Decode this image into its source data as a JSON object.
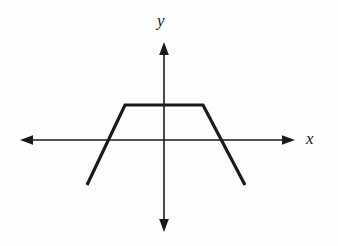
{
  "figure": {
    "background_color": "#fdfdfd",
    "stroke_color": "#1a1a1a",
    "axis_stroke_width": 1.6,
    "curve_stroke_width": 3.2
  },
  "axes": {
    "x_axis": {
      "label": "x",
      "label_style": "italic",
      "y_pixel": 140,
      "x_start_pixel": 20,
      "x_end_pixel": 295,
      "arrow_left": true,
      "arrow_right": true
    },
    "y_axis": {
      "label": "y",
      "label_style": "italic",
      "x_pixel": 164,
      "y_top_pixel": 42,
      "y_bottom_pixel": 232,
      "arrow_up": true,
      "arrow_down": true
    },
    "origin": {
      "x_pixel": 164,
      "y_pixel": 140
    },
    "ticks": [],
    "gridlines": false
  },
  "chart_data": {
    "type": "line",
    "title": "",
    "subtitle": "",
    "xlabel": "x",
    "ylabel": "y",
    "grid": false,
    "legend": null,
    "legend_position": "none",
    "axis_arrows": "both-ends-both-axes",
    "tick_labels": {
      "x": [],
      "y": []
    },
    "series": [
      {
        "name": "f",
        "points_pixel": [
          {
            "x": 87,
            "y": 185
          },
          {
            "x": 125,
            "y": 105
          },
          {
            "x": 203,
            "y": 105
          },
          {
            "x": 245,
            "y": 185
          }
        ],
        "points_graph": [
          {
            "x": -3.9,
            "y": -1.6
          },
          {
            "x": -2.4,
            "y": 1.5
          },
          {
            "x": 1.3,
            "y": 1.5
          },
          {
            "x": 3.0,
            "y": -1.6
          }
        ],
        "segments": [
          {
            "name": "rising-segment",
            "from_pixel": {
              "x": 87,
              "y": 185
            },
            "to_pixel": {
              "x": 125,
              "y": 105
            },
            "slope_sign": "positive"
          },
          {
            "name": "plateau-segment",
            "from_pixel": {
              "x": 125,
              "y": 105
            },
            "to_pixel": {
              "x": 203,
              "y": 105
            },
            "slope_sign": "zero"
          },
          {
            "name": "falling-segment",
            "from_pixel": {
              "x": 203,
              "y": 105
            },
            "to_pixel": {
              "x": 245,
              "y": 185
            },
            "slope_sign": "negative"
          }
        ],
        "x_intercepts_pixel": [
          107,
          222
        ],
        "plateau_y_pixel": 105
      }
    ],
    "xlim_pixel": [
      20,
      295
    ],
    "ylim_pixel": [
      42,
      232
    ]
  },
  "background_artifacts": {
    "note": "faint scanner bleed-through from the reverse page, illegible",
    "ghost_lines": [
      {
        "text": "",
        "left": 6,
        "top": 8
      },
      {
        "text": "",
        "left": 6,
        "top": 82
      },
      {
        "text": "",
        "left": 6,
        "top": 100
      }
    ]
  }
}
